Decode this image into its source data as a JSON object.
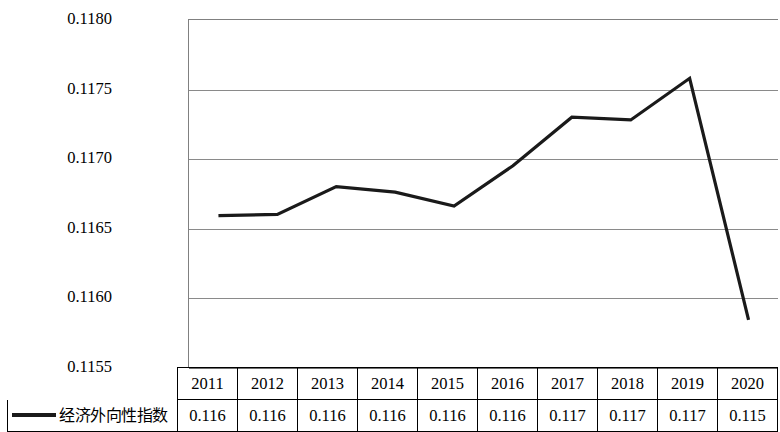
{
  "chart_data": {
    "type": "line",
    "title": "",
    "subtitle": "",
    "xlabel": "",
    "ylabel": "",
    "categories": [
      "2011",
      "2012",
      "2013",
      "2014",
      "2015",
      "2016",
      "2017",
      "2018",
      "2019",
      "2020"
    ],
    "series": [
      {
        "name": "经济外向性指数",
        "values": [
          0.11659,
          0.1166,
          0.1168,
          0.11676,
          0.11666,
          0.11695,
          0.1173,
          0.11728,
          0.11758,
          0.11584
        ],
        "color": "#1a1a1a",
        "line_width": 3.2
      }
    ],
    "ylim": [
      0.1155,
      0.118
    ],
    "yticks": [
      0.1155,
      0.116,
      0.1165,
      0.117,
      0.1175,
      0.118
    ],
    "ytick_labels": [
      "0.1155",
      "0.1160",
      "0.1165",
      "0.1170",
      "0.1175",
      "0.1180"
    ],
    "grid": true,
    "grid_axis": "y",
    "legend_position": "bottom-left",
    "markers": false,
    "data_table": {
      "row_label": "经济外向性指数",
      "header": [
        "2011",
        "2012",
        "2013",
        "2014",
        "2015",
        "2016",
        "2017",
        "2018",
        "2019",
        "2020"
      ],
      "values": [
        "0.116",
        "0.116",
        "0.116",
        "0.116",
        "0.116",
        "0.116",
        "0.117",
        "0.117",
        "0.117",
        "0.115"
      ]
    }
  },
  "legend": {
    "label": "经济外向性指数",
    "marker": "line-swatch"
  },
  "colors": {
    "series_line": "#1a1a1a",
    "gridline": "#8a8a8a",
    "axis": "#808080",
    "table_border": "#000000",
    "text": "#000000",
    "background": "#ffffff"
  }
}
